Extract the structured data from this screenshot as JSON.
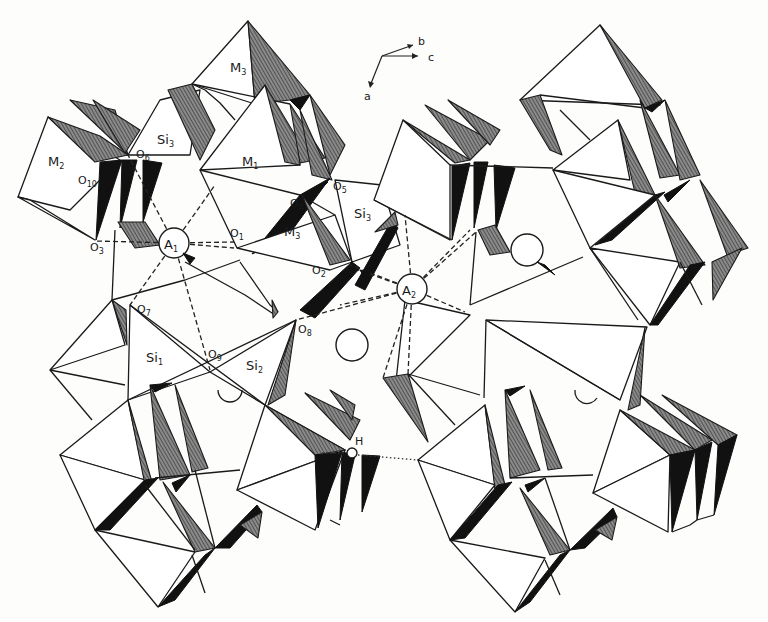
{
  "figure": {
    "type": "crystal-structure-polyhedral-diagram",
    "axes": {
      "labels": [
        "b",
        "c",
        "a"
      ]
    },
    "polyhedra_labels": [
      {
        "id": "M3_top",
        "text": "M",
        "sub": "3"
      },
      {
        "id": "Si3_left",
        "text": "Si",
        "sub": "3"
      },
      {
        "id": "M2",
        "text": "M",
        "sub": "2"
      },
      {
        "id": "M1",
        "text": "M",
        "sub": "1"
      },
      {
        "id": "M3_mid",
        "text": "M",
        "sub": "3"
      },
      {
        "id": "Si3_mid",
        "text": "Si",
        "sub": "3"
      },
      {
        "id": "Si1",
        "text": "Si",
        "sub": "1"
      },
      {
        "id": "Si2",
        "text": "Si",
        "sub": "2"
      }
    ],
    "oxygen_labels": [
      {
        "id": "O6",
        "text": "O",
        "sub": "6"
      },
      {
        "id": "O10",
        "text": "O",
        "sub": "10"
      },
      {
        "id": "O3",
        "text": "O",
        "sub": "3"
      },
      {
        "id": "O1",
        "text": "O",
        "sub": "1"
      },
      {
        "id": "O4",
        "text": "O",
        "sub": "4"
      },
      {
        "id": "O5",
        "text": "O",
        "sub": "5"
      },
      {
        "id": "O2",
        "text": "O",
        "sub": "2"
      },
      {
        "id": "O7",
        "text": "O",
        "sub": "7"
      },
      {
        "id": "O8",
        "text": "O",
        "sub": "8"
      },
      {
        "id": "O9",
        "text": "O",
        "sub": "9"
      }
    ],
    "sites": [
      {
        "id": "A1",
        "text": "A",
        "sub": "1"
      },
      {
        "id": "A2",
        "text": "A",
        "sub": "2"
      }
    ],
    "hydrogen_label": "H",
    "legend": {
      "dashed_lines": "A-site to O coordination bonds",
      "dotted_lines": "hydrogen bond"
    }
  }
}
